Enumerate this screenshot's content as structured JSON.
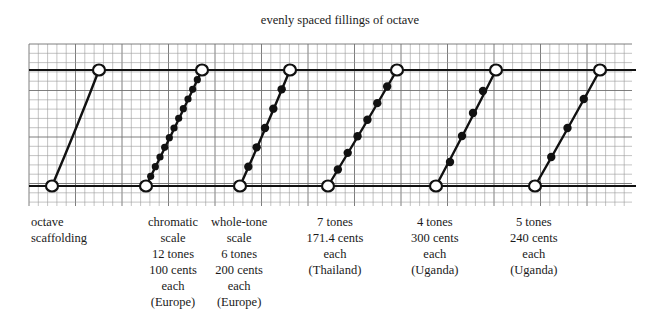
{
  "title": "evenly spaced fillings of octave",
  "colors": {
    "ink": "#111111",
    "grid": "#9a9a9a",
    "grid_major": "#6f6f6f",
    "background": "#ffffff"
  },
  "grid": {
    "left": 29,
    "right": 632,
    "top": 44,
    "bottom": 206,
    "cell": 9.3,
    "major_every": 5
  },
  "octave_lines": {
    "top_y": 70,
    "bottom_y": 186,
    "x_start": 29,
    "x_end": 636
  },
  "scales": [
    {
      "id": "octave-scaffolding",
      "caption": [
        "octave",
        "scaffolding"
      ],
      "caption_align": "left",
      "caption_x": 31,
      "start": [
        52,
        186
      ],
      "end": [
        99,
        70
      ],
      "intermediate_dots": 0
    },
    {
      "id": "chromatic",
      "caption": [
        "chromatic",
        "scale",
        "12 tones",
        "100 cents",
        "each",
        "(Europe)"
      ],
      "caption_align": "center",
      "caption_x": 148,
      "start": [
        146,
        186
      ],
      "end": [
        202,
        70
      ],
      "intermediate_dots": 11
    },
    {
      "id": "whole-tone",
      "caption": [
        "whole-tone",
        "scale",
        "6 tones",
        "200 cents",
        "each",
        "(Europe)"
      ],
      "caption_align": "center",
      "caption_center": 239,
      "start": [
        240,
        186
      ],
      "end": [
        290,
        70
      ],
      "intermediate_dots": 5
    },
    {
      "id": "seven-tones",
      "caption": [
        "7 tones",
        "171.4 cents",
        "each",
        "(Thailand)"
      ],
      "caption_align": "center",
      "caption_center": 335,
      "start": [
        328,
        186
      ],
      "end": [
        397,
        70
      ],
      "intermediate_dots": 6
    },
    {
      "id": "four-tones",
      "caption": [
        "4 tones",
        "300 cents",
        "each",
        "(Uganda)"
      ],
      "caption_align": "center",
      "caption_center": 435,
      "start": [
        436,
        186
      ],
      "end": [
        496,
        70
      ],
      "dots": [
        [
          450,
          162
        ],
        [
          462,
          136
        ],
        [
          473,
          113
        ],
        [
          483,
          91
        ]
      ]
    },
    {
      "id": "five-tones",
      "caption": [
        "5 tones",
        "240 cents",
        "each",
        "(Uganda)"
      ],
      "caption_align": "center",
      "caption_center": 534,
      "start": [
        535,
        186
      ],
      "end": [
        600,
        70
      ],
      "intermediate_dots": 3
    }
  ]
}
